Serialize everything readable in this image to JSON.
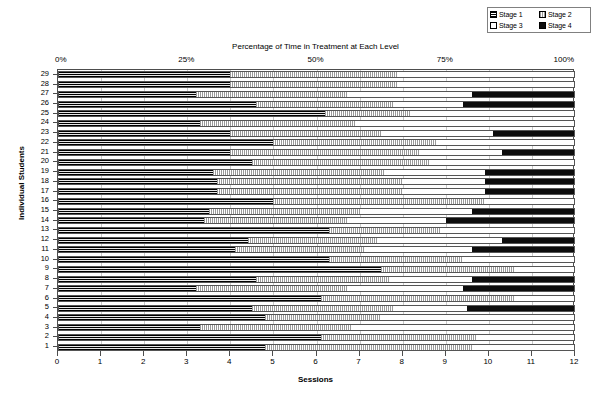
{
  "legend": {
    "name": "chart-legend",
    "items": [
      {
        "label": "Stage 1",
        "pattern": "pat-s1",
        "color": "#222222"
      },
      {
        "label": "Stage 2",
        "pattern": "pat-s2",
        "color": "#9a9a9a"
      },
      {
        "label": "Stage 3",
        "pattern": "pat-s3",
        "color": "#ffffff"
      },
      {
        "label": "Stage 4",
        "pattern": "pat-s4",
        "color": "#0d0d0d"
      }
    ]
  },
  "chart_data": {
    "type": "bar",
    "orientation": "horizontal",
    "stacked": true,
    "title": "",
    "top_axis_title": "Percentage of Time in Treatment at Each Level",
    "xlabel": "Sessions",
    "ylabel": "Individual Students",
    "xlim": [
      0,
      12
    ],
    "x_ticks": [
      "0",
      "1",
      "2",
      "3",
      "4",
      "5",
      "6",
      "7",
      "8",
      "9",
      "10",
      "11",
      "12"
    ],
    "top_axis_ticks": [
      "0%",
      "25%",
      "50%",
      "75%",
      "100%"
    ],
    "top_axis_tick_values": [
      0,
      25,
      50,
      75,
      100
    ],
    "grid": true,
    "legend_position": "top-right",
    "categories": [
      "29",
      "28",
      "27",
      "26",
      "25",
      "24",
      "23",
      "22",
      "21",
      "20",
      "19",
      "18",
      "17",
      "16",
      "15",
      "14",
      "13",
      "12",
      "11",
      "10",
      "9",
      "8",
      "7",
      "6",
      "5",
      "4",
      "3",
      "2",
      "1"
    ],
    "series": [
      {
        "name": "Stage 1",
        "pattern": "pat-s1"
      },
      {
        "name": "Stage 2",
        "pattern": "pat-s2"
      },
      {
        "name": "Stage 3",
        "pattern": "pat-s3"
      },
      {
        "name": "Stage 4",
        "pattern": "pat-s4"
      }
    ],
    "rows": [
      {
        "student": "29",
        "stage1": 4.0,
        "stage2": 3.9,
        "stage3": 4.1,
        "stage4": 0.0
      },
      {
        "student": "28",
        "stage1": 4.0,
        "stage2": 3.9,
        "stage3": 4.1,
        "stage4": 0.0
      },
      {
        "student": "27",
        "stage1": 3.2,
        "stage2": 3.5,
        "stage3": 2.9,
        "stage4": 2.4
      },
      {
        "student": "26",
        "stage1": 4.6,
        "stage2": 3.2,
        "stage3": 1.6,
        "stage4": 2.6
      },
      {
        "student": "25",
        "stage1": 6.2,
        "stage2": 2.0,
        "stage3": 3.8,
        "stage4": 0.0
      },
      {
        "student": "24",
        "stage1": 3.3,
        "stage2": 3.6,
        "stage3": 5.1,
        "stage4": 0.0
      },
      {
        "student": "23",
        "stage1": 4.0,
        "stage2": 3.5,
        "stage3": 2.6,
        "stage4": 1.9
      },
      {
        "student": "22",
        "stage1": 5.0,
        "stage2": 3.8,
        "stage3": 3.2,
        "stage4": 0.0
      },
      {
        "student": "21",
        "stage1": 4.0,
        "stage2": 4.4,
        "stage3": 1.9,
        "stage4": 1.7
      },
      {
        "student": "20",
        "stage1": 4.5,
        "stage2": 4.1,
        "stage3": 3.4,
        "stage4": 0.0
      },
      {
        "student": "19",
        "stage1": 3.6,
        "stage2": 4.0,
        "stage3": 2.3,
        "stage4": 2.1
      },
      {
        "student": "18",
        "stage1": 3.7,
        "stage2": 4.3,
        "stage3": 1.9,
        "stage4": 2.1
      },
      {
        "student": "17",
        "stage1": 3.7,
        "stage2": 4.3,
        "stage3": 1.9,
        "stage4": 2.1
      },
      {
        "student": "16",
        "stage1": 5.0,
        "stage2": 4.9,
        "stage3": 2.1,
        "stage4": 0.0
      },
      {
        "student": "15",
        "stage1": 3.5,
        "stage2": 3.5,
        "stage3": 2.6,
        "stage4": 2.4
      },
      {
        "student": "14",
        "stage1": 3.4,
        "stage2": 3.3,
        "stage3": 2.3,
        "stage4": 3.0
      },
      {
        "student": "13",
        "stage1": 6.3,
        "stage2": 2.6,
        "stage3": 3.1,
        "stage4": 0.0
      },
      {
        "student": "12",
        "stage1": 4.4,
        "stage2": 3.0,
        "stage3": 2.9,
        "stage4": 1.7
      },
      {
        "student": "11",
        "stage1": 4.1,
        "stage2": 3.0,
        "stage3": 2.5,
        "stage4": 2.4
      },
      {
        "student": "10",
        "stage1": 6.3,
        "stage2": 3.1,
        "stage3": 2.6,
        "stage4": 0.0
      },
      {
        "student": "9",
        "stage1": 7.5,
        "stage2": 3.1,
        "stage3": 1.4,
        "stage4": 0.0
      },
      {
        "student": "8",
        "stage1": 4.6,
        "stage2": 3.1,
        "stage3": 1.9,
        "stage4": 2.4
      },
      {
        "student": "7",
        "stage1": 3.2,
        "stage2": 3.5,
        "stage3": 2.7,
        "stage4": 2.6
      },
      {
        "student": "6",
        "stage1": 6.1,
        "stage2": 4.5,
        "stage3": 1.4,
        "stage4": 0.0
      },
      {
        "student": "5",
        "stage1": 4.5,
        "stage2": 3.3,
        "stage3": 1.7,
        "stage4": 2.5
      },
      {
        "student": "4",
        "stage1": 4.8,
        "stage2": 2.7,
        "stage3": 4.5,
        "stage4": 0.0
      },
      {
        "student": "3",
        "stage1": 3.3,
        "stage2": 3.5,
        "stage3": 5.2,
        "stage4": 0.0
      },
      {
        "student": "2",
        "stage1": 6.1,
        "stage2": 3.6,
        "stage3": 2.3,
        "stage4": 0.0
      },
      {
        "student": "1",
        "stage1": 4.8,
        "stage2": 4.8,
        "stage3": 2.4,
        "stage4": 0.0
      }
    ]
  }
}
